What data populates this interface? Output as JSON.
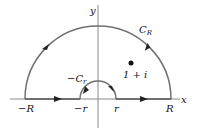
{
  "diagram": {
    "labels": {
      "y_axis": "y",
      "x_axis": "x",
      "C_R": "C",
      "C_R_sub": "R",
      "neg_C_r": "−C",
      "neg_C_r_sub": "r",
      "point": "1 + i",
      "neg_R": "−R",
      "neg_r": "−r",
      "r": "r",
      "R": "R"
    },
    "colors": {
      "axis": "#888888",
      "contour": "#707070",
      "text": "#111111"
    }
  }
}
